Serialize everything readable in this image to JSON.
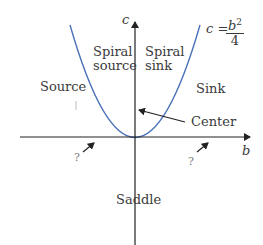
{
  "axes": {
    "x_label": "b",
    "y_label": "c"
  },
  "curve": {
    "equation_lhs": "c =",
    "equation_num": "b",
    "equation_exp": "2",
    "equation_den": "4",
    "color": "#4a72b8"
  },
  "regions": {
    "spiral_source_line1": "Spiral",
    "spiral_source_line2": "source",
    "spiral_sink_line1": "Spiral",
    "spiral_sink_line2": "sink",
    "source": "Source",
    "sink": "Sink",
    "center": "Center",
    "saddle": "Saddle",
    "unknown_left": "?",
    "unknown_right": "?"
  }
}
